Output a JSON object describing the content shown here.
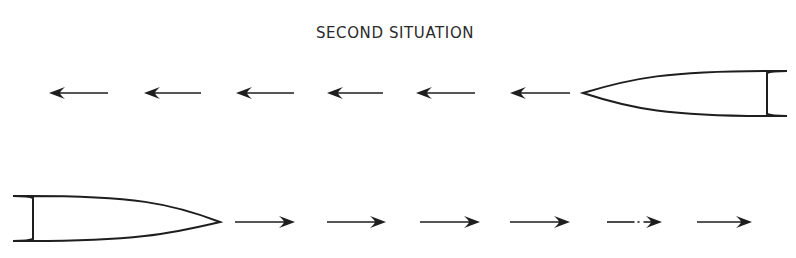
{
  "title": "SECOND SITUATION",
  "colors": {
    "ink": "#1e1e1e",
    "background": "#ffffff"
  },
  "rows": [
    {
      "name": "top-row",
      "direction": "left",
      "hull": {
        "bow_x": 583,
        "stern_x": 767,
        "top_y": 71,
        "bottom_y": 116,
        "center_y": 93,
        "points_toward": "left"
      },
      "arrows": [
        {
          "x1": 108,
          "x2": 49,
          "y": 93
        },
        {
          "x1": 201,
          "x2": 144,
          "y": 93
        },
        {
          "x1": 294,
          "x2": 236,
          "y": 93
        },
        {
          "x1": 383,
          "x2": 327,
          "y": 93
        },
        {
          "x1": 475,
          "x2": 416,
          "y": 93
        },
        {
          "x1": 570,
          "x2": 510,
          "y": 93
        }
      ]
    },
    {
      "name": "bottom-row",
      "direction": "right",
      "hull": {
        "bow_x": 220,
        "stern_x": 33,
        "top_y": 196,
        "bottom_y": 241,
        "center_y": 222,
        "points_toward": "right"
      },
      "arrows": [
        {
          "x1": 235,
          "x2": 295,
          "y": 222
        },
        {
          "x1": 327,
          "x2": 386,
          "y": 222
        },
        {
          "x1": 420,
          "x2": 480,
          "y": 222
        },
        {
          "x1": 510,
          "x2": 570,
          "y": 222
        },
        {
          "x1": 607,
          "x2": 662,
          "y": 222,
          "broken": true
        },
        {
          "x1": 697,
          "x2": 752,
          "y": 222
        }
      ]
    }
  ]
}
